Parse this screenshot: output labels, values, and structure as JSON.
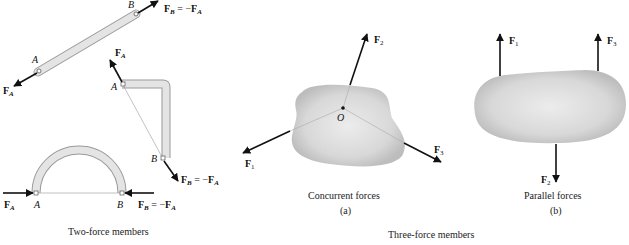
{
  "figure": {
    "left_panel": {
      "caption": "Two-force members",
      "members": [
        {
          "shape": "straight-bar",
          "points": [
            "A",
            "B"
          ],
          "forces": [
            "F_A",
            "F_B = −F_A"
          ]
        },
        {
          "shape": "L-bar",
          "points": [
            "A",
            "B"
          ],
          "forces": [
            "F_A",
            "F_B = −F_A"
          ]
        },
        {
          "shape": "semicircular-arch",
          "points": [
            "A",
            "B"
          ],
          "forces": [
            "F_A",
            "F_B = −F_A"
          ]
        }
      ]
    },
    "right_panel": {
      "caption": "Three-force members",
      "subfigures": [
        {
          "id": "a",
          "caption": "Concurrent forces",
          "tag": "(a)",
          "point": "O",
          "forces": [
            "F_1",
            "F_2",
            "F_3"
          ]
        },
        {
          "id": "b",
          "caption": "Parallel forces",
          "tag": "(b)",
          "forces": [
            "F_1",
            "F_2",
            "F_3"
          ]
        }
      ]
    },
    "labels": {
      "A": "A",
      "B": "B",
      "O": "O",
      "F": "F",
      "sub_A": "A",
      "sub_B": "B",
      "sub_1": "1",
      "sub_2": "2",
      "sub_3": "3",
      "eq_minus": " = −"
    }
  }
}
